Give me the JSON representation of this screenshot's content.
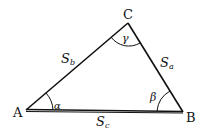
{
  "diagram": {
    "vertices": [
      {
        "id": "A",
        "label": "A",
        "x": 26,
        "y": 110
      },
      {
        "id": "B",
        "label": "B",
        "x": 183,
        "y": 112
      },
      {
        "id": "C",
        "label": "C",
        "x": 128,
        "y": 23
      }
    ],
    "sides": [
      {
        "id": "a",
        "label": "S",
        "sub": "a"
      },
      {
        "id": "b",
        "label": "S",
        "sub": "b"
      },
      {
        "id": "c",
        "label": "S",
        "sub": "c"
      }
    ],
    "angles": [
      {
        "vertex": "A",
        "symbol": "α"
      },
      {
        "vertex": "B",
        "symbol": "β"
      },
      {
        "vertex": "C",
        "symbol": "γ"
      }
    ]
  }
}
